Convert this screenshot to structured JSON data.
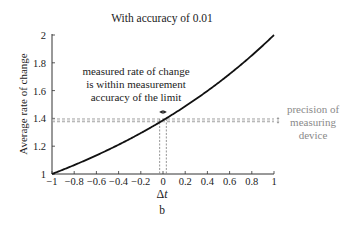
{
  "chart_data": {
    "type": "line",
    "title": "With accuracy of 0.01",
    "xlabel": "Δt",
    "ylabel": "Average rate of change",
    "subfigure_label": "b",
    "xlim": [
      -1,
      1
    ],
    "ylim": [
      1,
      2
    ],
    "x_ticks": [
      "−1",
      "−0.8",
      "−0.6",
      "−0.4",
      "−0.2",
      "0",
      "0.2",
      "0.4",
      "0.6",
      "0.8",
      "1"
    ],
    "y_ticks": [
      "1",
      "1.2",
      "1.4",
      "1.6",
      "1.8",
      "2"
    ],
    "grid": false,
    "series": [
      {
        "name": "average rate of change (2^(1+Δt) − 2)/Δt",
        "x": [
          -1,
          -0.8,
          -0.6,
          -0.4,
          -0.2,
          0,
          0.2,
          0.4,
          0.6,
          0.8,
          1
        ],
        "y": [
          1.0,
          1.065,
          1.135,
          1.21,
          1.294,
          1.386,
          1.487,
          1.598,
          1.719,
          1.852,
          2.0
        ]
      }
    ],
    "limit_value": 1.386,
    "precision_band": [
      1.376,
      1.396
    ],
    "accuracy_interval": [
      -0.03,
      0.03
    ],
    "annotations": [
      {
        "text": "measured rate of change is within measurement accuracy of the limit",
        "lines": [
          "measured rate of change",
          "is within measurement",
          "accuracy of the limit"
        ]
      },
      {
        "text": "precision of measuring device",
        "lines": [
          "precision of",
          "measuring",
          "device"
        ],
        "color": "#8a8a8a"
      }
    ]
  }
}
